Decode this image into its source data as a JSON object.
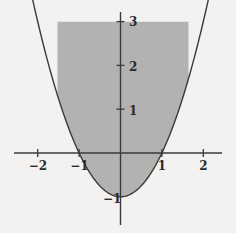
{
  "figure": {
    "title": "",
    "background_color": "#f4f2f0",
    "fill_color": "#b3b2b0",
    "axis_color": "#3a3a3a",
    "curve_color": "#3a3a3a"
  },
  "chart_data": {
    "type": "area",
    "title": "",
    "subtitle": "",
    "xlabel": "",
    "ylabel": "",
    "xlim": [
      -2.6,
      2.6
    ],
    "ylim": [
      -1.45,
      3.45
    ],
    "grid": false,
    "legend": null,
    "x_ticks": [
      -2,
      -1,
      1,
      2
    ],
    "x_tick_labels": [
      "−2",
      "−1",
      "1",
      "2"
    ],
    "y_ticks": [
      1,
      2,
      3,
      -1
    ],
    "y_tick_labels": [
      "1",
      "2",
      "3",
      "−1"
    ],
    "curve": {
      "name": "y = x² − 1",
      "equation": "y = x^2 - 1",
      "vertex": [
        0,
        -1
      ],
      "roots": [
        -1,
        1
      ],
      "x": [
        -1.8,
        -1.6,
        -1.4,
        -1.2,
        -1.0,
        -0.8,
        -0.6,
        -0.4,
        -0.2,
        0.0,
        0.2,
        0.4,
        0.6,
        0.8,
        1.0,
        1.2,
        1.4,
        1.6,
        1.8
      ],
      "y": [
        2.24,
        1.56,
        0.96,
        0.44,
        0.0,
        -0.36,
        -0.64,
        -0.84,
        -0.96,
        -1.0,
        -0.96,
        -0.84,
        -0.64,
        -0.36,
        0.0,
        0.44,
        0.96,
        1.56,
        2.24
      ]
    },
    "shaded_region": {
      "description": "Region between the parabola y = x² − 1 and the horizontal line y = 3",
      "lower_bound": "y = x^2 - 1",
      "upper_bound": "y = 3",
      "x_range": [
        -2,
        2
      ],
      "y_range": [
        -1,
        3
      ],
      "fill": "#b3b2b0"
    }
  },
  "labels": {
    "x": [
      {
        "text": "−2",
        "value": -2
      },
      {
        "text": "−1",
        "value": -1
      },
      {
        "text": "1",
        "value": 1
      },
      {
        "text": "2",
        "value": 2
      }
    ],
    "y": [
      {
        "text": "3",
        "value": 3
      },
      {
        "text": "2",
        "value": 2
      },
      {
        "text": "1",
        "value": 1
      },
      {
        "text": "−1",
        "value": -1
      }
    ]
  }
}
